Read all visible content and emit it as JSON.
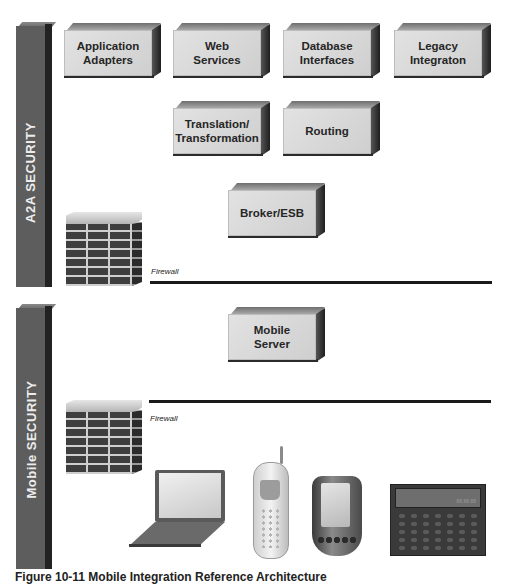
{
  "pillars": {
    "a2a": {
      "label": "A2A SECURITY"
    },
    "mobile": {
      "label": "Mobile SECURITY"
    }
  },
  "boxes": {
    "application_adapters": {
      "label": "Application\nAdapters"
    },
    "web_services": {
      "label": "Web\nServices"
    },
    "database_interfaces": {
      "label": "Database\nInterfaces"
    },
    "legacy_integration": {
      "label": "Legacy\nIntegraton"
    },
    "translation_transformation": {
      "label": "Translation/\nTransformation"
    },
    "routing": {
      "label": "Routing"
    },
    "broker_esb": {
      "label": "Broker/ESB"
    },
    "mobile_server": {
      "label": "Mobile\nServer"
    }
  },
  "firewalls": [
    {
      "label": "Firewall"
    },
    {
      "label": "Firewall"
    }
  ],
  "devices": [
    {
      "name": "laptop-icon"
    },
    {
      "name": "mobile-phone-icon"
    },
    {
      "name": "pda-icon"
    },
    {
      "name": "pager-calculator-icon",
      "display": "88.88.88"
    }
  ],
  "caption": {
    "text": "Figure 10-11 Mobile Integration Reference Architecture"
  },
  "colors": {
    "pillar": "#5d5d5d",
    "box_face": "#d8d8d8",
    "firewall_line": "#1a1a1a"
  }
}
